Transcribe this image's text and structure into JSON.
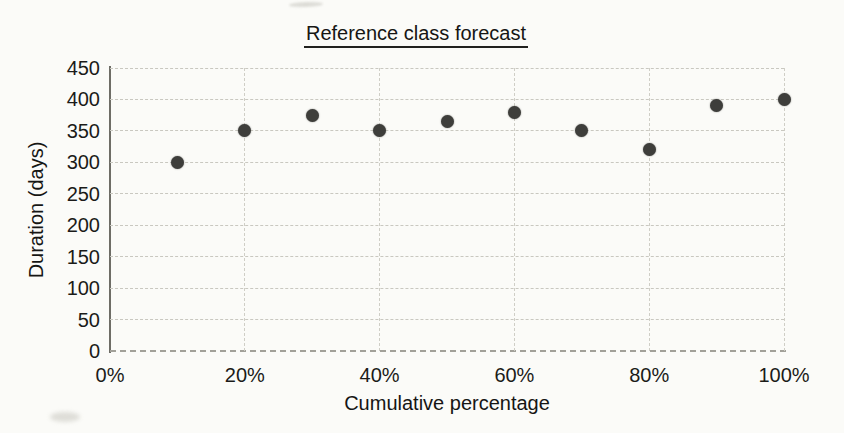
{
  "figure": {
    "title": "Reference class forecast"
  },
  "colors": {
    "background": "#fbfbf8",
    "point": "#3e3e3b",
    "gridline": "#c9c8c0",
    "axis": "#6e6d66",
    "text": "#1a1a18"
  },
  "chart_data": {
    "type": "scatter",
    "title": "Reference class forecast",
    "xlabel": "Cumulative percentage",
    "ylabel": "Duration (days)",
    "x": [
      10,
      20,
      30,
      40,
      50,
      60,
      70,
      80,
      90,
      100
    ],
    "y": [
      300,
      350,
      375,
      350,
      365,
      380,
      350,
      320,
      390,
      400
    ],
    "xlim": [
      0,
      100
    ],
    "ylim": [
      0,
      450
    ],
    "x_tick_values": [
      0,
      20,
      40,
      60,
      80,
      100
    ],
    "x_tick_labels": [
      "0%",
      "20%",
      "40%",
      "60%",
      "80%",
      "100%"
    ],
    "y_tick_values": [
      0,
      50,
      100,
      150,
      200,
      250,
      300,
      350,
      400,
      450
    ],
    "y_tick_labels": [
      "0",
      "50",
      "100",
      "150",
      "200",
      "250",
      "300",
      "350",
      "400",
      "450"
    ],
    "grid": true,
    "legend_position": "none",
    "marker_size_px": 13
  }
}
